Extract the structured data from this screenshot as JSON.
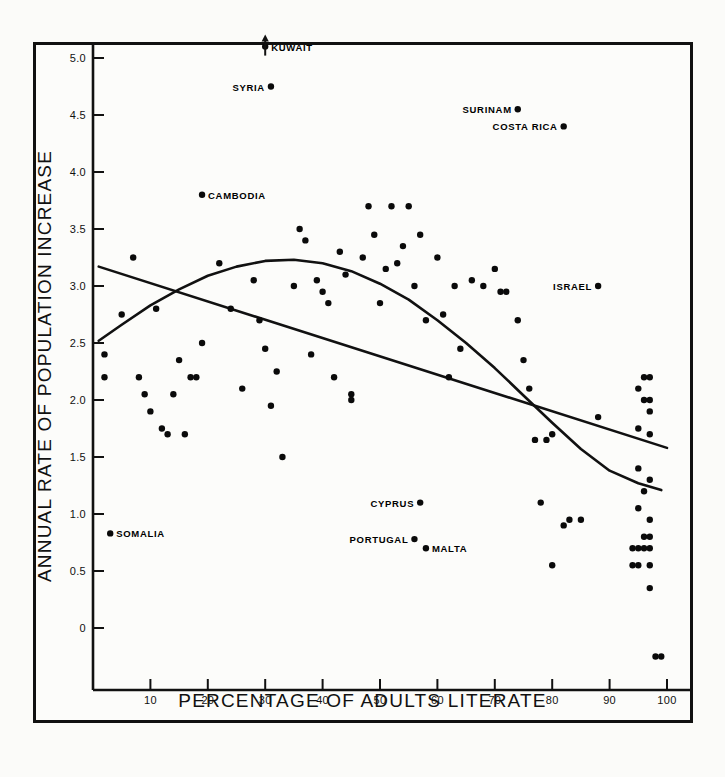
{
  "chart_data": {
    "type": "scatter",
    "title": "",
    "xlabel": "PERCENTAGE OF ADULTS LITERATE",
    "ylabel": "ANNUAL RATE OF POPULATION INCREASE",
    "xlim": [
      0,
      104
    ],
    "ylim": [
      -0.4,
      5.15
    ],
    "grid": false,
    "legend": "none",
    "xticks": [
      10,
      20,
      30,
      40,
      50,
      60,
      70,
      80,
      90,
      100
    ],
    "xtick_labels": [
      "10",
      "20",
      "30",
      "40",
      "50",
      "60",
      "70",
      "80",
      "90",
      "100"
    ],
    "yticks": [
      0,
      0.5,
      1.0,
      1.5,
      2.0,
      2.5,
      3.0,
      3.5,
      4.0,
      4.5,
      5.0
    ],
    "ytick_labels": [
      "0",
      "0.5",
      "1.0",
      "1.5",
      "2.0",
      "2.5",
      "3.0",
      "3.5",
      "4.0",
      "4.5",
      "5.0"
    ],
    "points": [
      [
        2,
        2.2
      ],
      [
        2,
        2.4
      ],
      [
        5,
        2.75
      ],
      [
        7,
        3.25
      ],
      [
        8,
        2.2
      ],
      [
        9,
        2.05
      ],
      [
        10,
        1.9
      ],
      [
        11,
        2.8
      ],
      [
        12,
        1.75
      ],
      [
        13,
        1.7
      ],
      [
        14,
        2.05
      ],
      [
        15,
        2.35
      ],
      [
        16,
        1.7
      ],
      [
        17,
        2.2
      ],
      [
        18,
        2.2
      ],
      [
        19,
        2.5
      ],
      [
        22,
        3.2
      ],
      [
        24,
        2.8
      ],
      [
        26,
        2.1
      ],
      [
        28,
        3.05
      ],
      [
        29,
        2.7
      ],
      [
        30,
        2.45
      ],
      [
        31,
        1.95
      ],
      [
        32,
        2.25
      ],
      [
        33,
        1.5
      ],
      [
        35,
        3.0
      ],
      [
        36,
        3.5
      ],
      [
        37,
        3.4
      ],
      [
        38,
        2.4
      ],
      [
        39,
        3.05
      ],
      [
        40,
        2.95
      ],
      [
        41,
        2.85
      ],
      [
        42,
        2.2
      ],
      [
        43,
        3.3
      ],
      [
        44,
        3.1
      ],
      [
        45,
        2.05
      ],
      [
        45,
        2.0
      ],
      [
        47,
        3.25
      ],
      [
        48,
        3.7
      ],
      [
        49,
        3.45
      ],
      [
        50,
        2.85
      ],
      [
        51,
        3.15
      ],
      [
        52,
        3.7
      ],
      [
        53,
        3.2
      ],
      [
        54,
        3.35
      ],
      [
        55,
        3.7
      ],
      [
        56,
        3.0
      ],
      [
        57,
        3.45
      ],
      [
        58,
        2.7
      ],
      [
        60,
        3.25
      ],
      [
        61,
        2.75
      ],
      [
        62,
        2.2
      ],
      [
        63,
        3.0
      ],
      [
        64,
        2.45
      ],
      [
        66,
        3.05
      ],
      [
        68,
        3.0
      ],
      [
        70,
        3.15
      ],
      [
        71,
        2.95
      ],
      [
        72,
        2.95
      ],
      [
        74,
        2.7
      ],
      [
        75,
        2.35
      ],
      [
        76,
        2.1
      ],
      [
        77,
        1.65
      ],
      [
        78,
        1.1
      ],
      [
        79,
        1.65
      ],
      [
        80,
        1.7
      ],
      [
        82,
        0.9
      ],
      [
        83,
        0.95
      ],
      [
        85,
        0.95
      ],
      [
        80,
        0.55
      ],
      [
        88,
        1.85
      ],
      [
        95,
        2.1
      ],
      [
        96,
        2.2
      ],
      [
        97,
        2.2
      ],
      [
        96,
        2.0
      ],
      [
        97,
        2.0
      ],
      [
        97,
        1.9
      ],
      [
        95,
        1.75
      ],
      [
        97,
        1.7
      ],
      [
        95,
        1.4
      ],
      [
        97,
        1.3
      ],
      [
        96,
        1.2
      ],
      [
        95,
        1.05
      ],
      [
        97,
        0.95
      ],
      [
        96,
        0.8
      ],
      [
        97,
        0.8
      ],
      [
        94,
        0.7
      ],
      [
        95,
        0.7
      ],
      [
        96,
        0.7
      ],
      [
        97,
        0.7
      ],
      [
        94,
        0.55
      ],
      [
        95,
        0.55
      ],
      [
        97,
        0.55
      ],
      [
        97,
        0.35
      ],
      [
        98,
        -0.25
      ],
      [
        99,
        -0.25
      ]
    ],
    "labeled_points": [
      {
        "name": "KUWAIT",
        "x": 30,
        "y": 5.1,
        "label_side": "right",
        "offscale_arrow": true
      },
      {
        "name": "SYRIA",
        "x": 31,
        "y": 4.75,
        "label_side": "left"
      },
      {
        "name": "SURINAM",
        "x": 74,
        "y": 4.55,
        "label_side": "left"
      },
      {
        "name": "COSTA RICA",
        "x": 82,
        "y": 4.4,
        "label_side": "left"
      },
      {
        "name": "CAMBODIA",
        "x": 19,
        "y": 3.8,
        "label_side": "right"
      },
      {
        "name": "ISRAEL",
        "x": 88,
        "y": 3.0,
        "label_side": "left"
      },
      {
        "name": "CYPRUS",
        "x": 57,
        "y": 1.1,
        "label_side": "left"
      },
      {
        "name": "SOMALIA",
        "x": 3,
        "y": 0.83,
        "label_side": "right"
      },
      {
        "name": "PORTUGAL",
        "x": 56,
        "y": 0.78,
        "label_side": "left"
      },
      {
        "name": "MALTA",
        "x": 58,
        "y": 0.7,
        "label_side": "right"
      }
    ],
    "curves": [
      {
        "name": "quadratic-fit-curve",
        "description": "inverted-U parabolic trend line peaking near 37% literacy at about 3.23",
        "points": [
          [
            1,
            2.52
          ],
          [
            5,
            2.66
          ],
          [
            10,
            2.83
          ],
          [
            15,
            2.97
          ],
          [
            20,
            3.09
          ],
          [
            25,
            3.17
          ],
          [
            30,
            3.22
          ],
          [
            35,
            3.23
          ],
          [
            40,
            3.2
          ],
          [
            45,
            3.13
          ],
          [
            50,
            3.02
          ],
          [
            55,
            2.88
          ],
          [
            60,
            2.7
          ],
          [
            65,
            2.5
          ],
          [
            70,
            2.28
          ],
          [
            75,
            2.04
          ],
          [
            80,
            1.8
          ],
          [
            85,
            1.57
          ],
          [
            90,
            1.38
          ],
          [
            95,
            1.27
          ],
          [
            99,
            1.21
          ]
        ]
      },
      {
        "name": "linear-regression-line",
        "description": "straight declining regression line from about 3.17 at 1% to 1.58 at 100%",
        "points": [
          [
            1,
            3.17
          ],
          [
            100,
            1.58
          ]
        ]
      }
    ]
  },
  "axes": {
    "x_axis_label": "PERCENTAGE OF ADULTS LITERATE",
    "y_axis_label": "ANNUAL RATE OF POPULATION INCREASE"
  }
}
